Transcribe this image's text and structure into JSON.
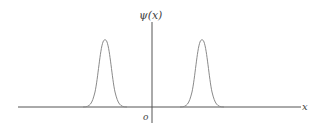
{
  "diagram": {
    "y_axis_label": "ψ(x)",
    "x_axis_label": "x",
    "origin_label": "o",
    "colors": {
      "axis": "#555555",
      "curve": "#8a8a8a",
      "text": "#444444"
    },
    "peaks": [
      {
        "name": "left-peak",
        "center_px": 105,
        "top_px": 38
      },
      {
        "name": "right-peak",
        "center_px": 202,
        "top_px": 38
      }
    ]
  }
}
